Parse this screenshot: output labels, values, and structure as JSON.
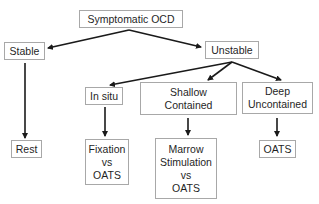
{
  "diagram": {
    "nodes": {
      "root": {
        "lines": [
          "Symptomatic OCD"
        ]
      },
      "stable": {
        "lines": [
          "Stable"
        ]
      },
      "unstable": {
        "lines": [
          "Unstable"
        ]
      },
      "in_situ": {
        "lines": [
          "In situ"
        ]
      },
      "shallow": {
        "lines": [
          "Shallow",
          "Contained"
        ]
      },
      "deep": {
        "lines": [
          "Deep",
          "Uncontained"
        ]
      },
      "rest": {
        "lines": [
          "Rest"
        ]
      },
      "fixation": {
        "lines": [
          "Fixation",
          "vs",
          "OATS"
        ]
      },
      "marrow": {
        "lines": [
          "Marrow",
          "Stimulation",
          "vs",
          "OATS"
        ]
      },
      "oats": {
        "lines": [
          "OATS"
        ]
      }
    },
    "edges": [
      {
        "from": "Symptomatic OCD",
        "to": "Stable"
      },
      {
        "from": "Symptomatic OCD",
        "to": "Unstable"
      },
      {
        "from": "Stable",
        "to": "Rest"
      },
      {
        "from": "Unstable",
        "to": "In situ"
      },
      {
        "from": "Unstable",
        "to": "Shallow Contained"
      },
      {
        "from": "Unstable",
        "to": "Deep Uncontained"
      },
      {
        "from": "In situ",
        "to": "Fixation vs OATS"
      },
      {
        "from": "Shallow Contained",
        "to": "Marrow Stimulation vs OATS"
      },
      {
        "from": "Deep Uncontained",
        "to": "OATS"
      }
    ],
    "colors": {
      "border": "#a8a8a8",
      "arrow": "#1a1a1a",
      "text": "#1f1f1f"
    }
  }
}
